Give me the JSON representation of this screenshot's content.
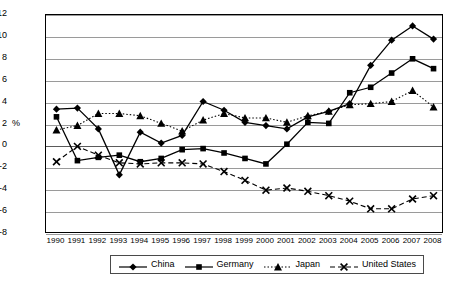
{
  "chart_data": {
    "type": "line",
    "title": "",
    "xlabel": "",
    "ylabel": "%",
    "ylim": [
      -8,
      12
    ],
    "ytick_step": 2,
    "grid": true,
    "legend_position": "bottom",
    "categories": [
      "1990",
      "1991",
      "1992",
      "1993",
      "1994",
      "1995",
      "1996",
      "1997",
      "1998",
      "1999",
      "2000",
      "2001",
      "2002",
      "2003",
      "2004",
      "2005",
      "2006",
      "2007",
      "2008"
    ],
    "yticks": [
      "12",
      "10",
      "8",
      "6",
      "4",
      "2",
      "0",
      "-2",
      "-4",
      "-6",
      "-8"
    ],
    "series": [
      {
        "name": "China",
        "marker": "diamond",
        "line_style": "solid",
        "color": "#000000",
        "values": [
          3.4,
          3.5,
          1.6,
          -2.6,
          1.3,
          0.3,
          1.0,
          4.1,
          3.3,
          2.2,
          1.9,
          1.6,
          2.7,
          3.2,
          3.9,
          7.4,
          9.7,
          11.0,
          9.8
        ]
      },
      {
        "name": "Germany",
        "marker": "square",
        "line_style": "solid",
        "color": "#000000",
        "values": [
          2.7,
          -1.3,
          -1.0,
          -0.8,
          -1.4,
          -1.1,
          -0.3,
          -0.2,
          -0.6,
          -1.1,
          -1.6,
          0.2,
          2.2,
          2.1,
          4.9,
          5.4,
          6.7,
          8.0,
          7.1
        ]
      },
      {
        "name": "Japan",
        "marker": "triangle",
        "line_style": "dotted",
        "color": "#000000",
        "values": [
          1.5,
          1.9,
          3.0,
          3.0,
          2.8,
          2.1,
          1.4,
          2.4,
          3.0,
          2.6,
          2.6,
          2.2,
          2.8,
          3.2,
          3.8,
          3.9,
          4.1,
          5.1,
          3.6
        ]
      },
      {
        "name": "United States",
        "marker": "cross",
        "line_style": "dashed",
        "color": "#000000",
        "values": [
          -1.4,
          0.0,
          -0.8,
          -1.5,
          -1.6,
          -1.5,
          -1.5,
          -1.6,
          -2.3,
          -3.1,
          -4.0,
          -3.8,
          -4.1,
          -4.5,
          -5.0,
          -5.7,
          -5.7,
          -4.8,
          -4.5
        ]
      }
    ]
  },
  "axes": {
    "y_label": "%",
    "y_ticks": [
      "12",
      "10",
      "8",
      "6",
      "4",
      "2",
      "0",
      "-2",
      "-4",
      "-6",
      "-8"
    ],
    "x_ticks": [
      "1990",
      "1991",
      "1992",
      "1993",
      "1994",
      "1995",
      "1996",
      "1997",
      "1998",
      "1999",
      "2000",
      "2001",
      "2002",
      "2003",
      "2004",
      "2005",
      "2006",
      "2007",
      "2008"
    ]
  },
  "legend": {
    "items": [
      {
        "label": "China",
        "marker": "diamond-marker-icon"
      },
      {
        "label": "Germany",
        "marker": "square-marker-icon"
      },
      {
        "label": "Japan",
        "marker": "triangle-marker-icon"
      },
      {
        "label": "United States",
        "marker": "cross-marker-icon"
      }
    ]
  }
}
